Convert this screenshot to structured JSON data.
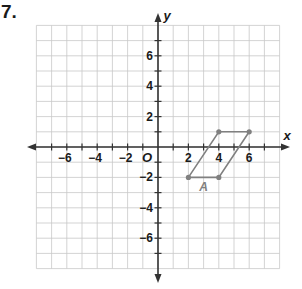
{
  "problem": {
    "number": "7."
  },
  "graph": {
    "x_axis": {
      "label": "x",
      "min": -8,
      "max": 8,
      "tick_labels": [
        "-6",
        "-4",
        "-2",
        "2",
        "4",
        "6"
      ],
      "tick_values": [
        -6,
        -4,
        -2,
        2,
        4,
        6
      ]
    },
    "y_axis": {
      "label": "y",
      "min": -8,
      "max": 8,
      "tick_labels": [
        "6",
        "4",
        "2",
        "-2",
        "-4",
        "-6"
      ],
      "tick_values": [
        6,
        4,
        2,
        -2,
        -4,
        -6
      ]
    },
    "origin_label": "O",
    "grid": {
      "on": true,
      "step": 1,
      "color": "#c8c8c8"
    },
    "axis_color": "#333333",
    "shape": {
      "name": "A",
      "type": "parallelogram",
      "vertices": [
        [
          2,
          -2
        ],
        [
          4,
          -2
        ],
        [
          6,
          1
        ],
        [
          4,
          1
        ]
      ],
      "color": "#808080",
      "label_position": [
        3,
        -2.6
      ]
    }
  },
  "chart_data": {
    "type": "scatter",
    "title": "",
    "xlabel": "x",
    "ylabel": "y",
    "xlim": [
      -8,
      8
    ],
    "ylim": [
      -8,
      8
    ],
    "grid": true,
    "series": [
      {
        "name": "A",
        "points": [
          [
            2,
            -2
          ],
          [
            4,
            -2
          ],
          [
            6,
            1
          ],
          [
            4,
            1
          ]
        ],
        "closed_polygon": true
      }
    ]
  }
}
